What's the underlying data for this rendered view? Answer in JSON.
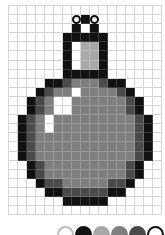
{
  "editor": {
    "grid": {
      "columns": 17,
      "rows": 23,
      "legend": {
        "0": "empty",
        "W": "white",
        "K": "black",
        "L": "light-gray",
        "M": "mid-gray",
        "D": "dark-gray",
        "O": "white-dot"
      },
      "cells": [
        "00000000000000000",
        "0000000OKO0000000",
        "0000000KWK0000000",
        "000000KKKKK000000",
        "000000KWLLK000000",
        "000000KWLLK000000",
        "000000KWLLK000000",
        "000000KKKKK000000",
        "0000KKDMMMDKK0000",
        "000KDMMWMMMMDK000",
        "00KDMWWMMMMMMDK00",
        "00KDMWWMMMMMMDK00",
        "0KDMWMMMMMMMMMDK0",
        "0KDMWMMMMMMMMMDK0",
        "0KDMMMMMMMMMMMDK0",
        "0KDMMMMMMMMMMMDK0",
        "0KDMMMMMMMMMMMDK0",
        "00KDMMMMMMMMMDK00",
        "00KDMMMMMMMMMDK00",
        "000KDDMMMMMDDK000",
        "0000KKDDDDDKK0000",
        "000000KKKKK000000",
        "00000000000000000"
      ]
    },
    "palette": [
      {
        "name": "white",
        "color": "#ffffff",
        "border": "#bbbbbb"
      },
      {
        "name": "black",
        "color": "#111111",
        "border": "#111111"
      },
      {
        "name": "light-gray",
        "color": "#a8a8a8",
        "border": "#a8a8a8"
      },
      {
        "name": "mid-gray",
        "color": "#7f7f7f",
        "border": "#7f7f7f"
      },
      {
        "name": "dark-gray",
        "color": "#4a4a4a",
        "border": "#4a4a4a"
      },
      {
        "name": "outline",
        "color": "#ffffff",
        "border": "#111111"
      }
    ]
  }
}
